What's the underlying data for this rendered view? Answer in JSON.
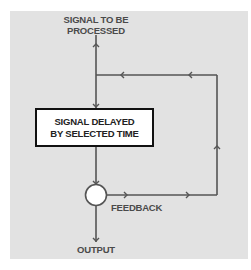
{
  "diagram": {
    "type": "signal-flow",
    "colors": {
      "background": "#e2e2e2",
      "line": "#555555",
      "box_border": "#111111",
      "box_fill": "#ffffff",
      "text": "#4a4a4a"
    },
    "nodes": {
      "input_label": "SIGNAL TO BE PROCESSED",
      "input_line1": "SIGNAL TO BE",
      "input_line2": "PROCESSED",
      "delay_box_line1": "SIGNAL DELAYED",
      "delay_box_line2": "BY SELECTED TIME",
      "summing_junction": "circle",
      "feedback_label": "FEEDBACK",
      "output_label": "OUTPUT"
    },
    "edges": [
      {
        "from": "input",
        "to": "delay_box"
      },
      {
        "from": "delay_box",
        "to": "summing_junction"
      },
      {
        "from": "summing_junction",
        "to": "output"
      },
      {
        "from": "summing_junction",
        "to": "feedback_loop",
        "label": "FEEDBACK"
      },
      {
        "from": "feedback_loop",
        "to": "input_line"
      }
    ]
  }
}
